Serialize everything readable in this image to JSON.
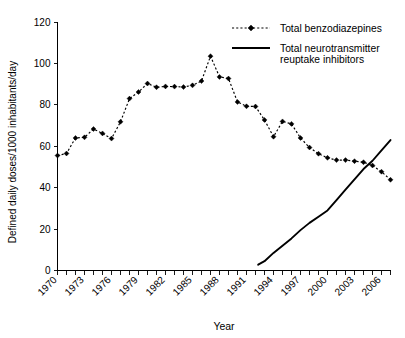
{
  "chart_data": {
    "type": "line",
    "title": "",
    "xlabel": "Year",
    "ylabel": "Defined daily doses/1000 inhabitants/day",
    "xlim": [
      1970,
      2007
    ],
    "ylim": [
      0,
      120
    ],
    "y_ticks": [
      0,
      20,
      40,
      60,
      80,
      100,
      120
    ],
    "x_ticks_major": [
      1970,
      1973,
      1976,
      1979,
      1982,
      1985,
      1988,
      1991,
      1994,
      1997,
      2000,
      2003,
      2006
    ],
    "x_ticks_minor_step": 1,
    "grid": false,
    "legend_position": "top-right",
    "series": [
      {
        "name": "Total benzodiazepines",
        "style": "dashed-with-diamond-markers",
        "x": [
          1970,
          1971,
          1972,
          1973,
          1974,
          1975,
          1976,
          1977,
          1978,
          1979,
          1980,
          1981,
          1982,
          1983,
          1984,
          1985,
          1986,
          1987,
          1988,
          1989,
          1990,
          1991,
          1992,
          1993,
          1994,
          1995,
          1996,
          1997,
          1998,
          1999,
          2000,
          2001,
          2002,
          2003,
          2004,
          2005,
          2006,
          2007
        ],
        "values": [
          55.5,
          56.5,
          64.0,
          64.3,
          68.3,
          66.2,
          63.7,
          71.8,
          83.0,
          86.2,
          90.3,
          88.5,
          88.9,
          88.8,
          88.6,
          89.4,
          91.5,
          103.5,
          93.5,
          92.7,
          81.4,
          79.3,
          79.2,
          72.7,
          64.6,
          72.0,
          70.8,
          64.0,
          59.4,
          56.4,
          54.4,
          53.3,
          53.3,
          52.8,
          52.3,
          50.7,
          47.7,
          43.8
        ]
      },
      {
        "name": "Total neurotransmitter reuptake inhibitors",
        "style": "solid-line",
        "x": [
          1992.3,
          1993,
          1994,
          1995,
          1996,
          1997,
          1998,
          1999,
          2000,
          2001,
          2002,
          2003,
          2004,
          2005,
          2006,
          2007
        ],
        "values": [
          2.8,
          4.5,
          8.5,
          12.0,
          15.5,
          19.5,
          23.0,
          26.0,
          29.0,
          34.0,
          39.0,
          44.0,
          49.0,
          53.0,
          58.0,
          63.0
        ]
      }
    ]
  },
  "legend": {
    "items": [
      {
        "label": "Total benzodiazepines",
        "marker": "dashed-diamond"
      },
      {
        "label": "Total neurotransmitter",
        "label2": "reuptake inhibitors",
        "marker": "solid"
      }
    ]
  },
  "axes": {
    "y_title": "Defined daily doses/1000 inhabitants/day",
    "x_title": "Year",
    "y_tick_labels": [
      "0",
      "20",
      "40",
      "60",
      "80",
      "100",
      "120"
    ],
    "x_tick_labels": [
      "1970",
      "1973",
      "1976",
      "1979",
      "1982",
      "1985",
      "1988",
      "1991",
      "1994",
      "1997",
      "2000",
      "2003",
      "2006"
    ]
  },
  "colors": {
    "ink": "#000000",
    "background": "#ffffff"
  }
}
